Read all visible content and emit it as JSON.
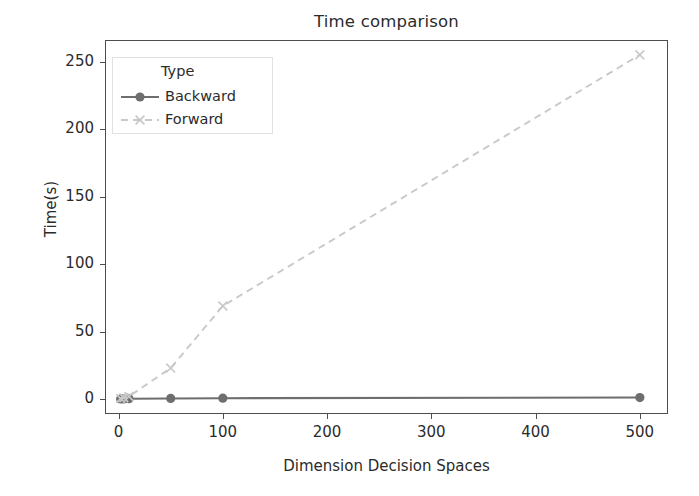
{
  "chart_data": {
    "type": "line",
    "title": "Time comparison",
    "xlabel": "Dimension Decision Spaces",
    "ylabel": "Time(s)",
    "xlim": [
      -13,
      527
    ],
    "ylim": [
      -11,
      266
    ],
    "xticks": [
      0,
      100,
      200,
      300,
      400,
      500
    ],
    "yticks": [
      0,
      50,
      100,
      150,
      200,
      250
    ],
    "grid": false,
    "legend": {
      "title": "Type",
      "position": "upper-left-inside",
      "entries": [
        {
          "name": "Backward",
          "color": "#6e6e6e",
          "linestyle": "solid",
          "marker": "circle"
        },
        {
          "name": "Forward",
          "color": "#c9c9c9",
          "linestyle": "dashed",
          "marker": "x"
        }
      ]
    },
    "x": [
      2,
      5,
      10,
      50,
      100,
      500
    ],
    "series": [
      {
        "name": "Backward",
        "color": "#6e6e6e",
        "linestyle": "solid",
        "marker": "circle",
        "values": [
          0.1,
          0.2,
          0.3,
          0.5,
          0.7,
          1.2
        ]
      },
      {
        "name": "Forward",
        "color": "#c9c9c9",
        "linestyle": "dashed",
        "marker": "x",
        "values": [
          0.5,
          1.0,
          2.0,
          23.0,
          69.0,
          255.0
        ]
      }
    ]
  },
  "figure": {
    "background": "#ffffff",
    "axes_edge_color": "#4d4d4d",
    "text_color": "#2b2b2b"
  }
}
